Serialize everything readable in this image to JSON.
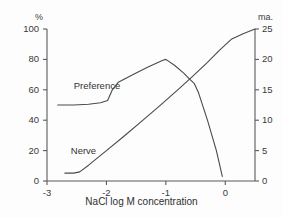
{
  "chart_data": {
    "type": "line",
    "title": "",
    "subtitle": "",
    "xlabel": "NaCl log M concentration",
    "ylabel_left": "%",
    "ylabel_right": "ma.",
    "xlim": [
      -3.0,
      0.5
    ],
    "xticks": [
      -3,
      -2,
      -1,
      0
    ],
    "xticklabels": [
      "-3",
      "-2",
      "-1",
      "0"
    ],
    "ylim_left": [
      0,
      100
    ],
    "yticks_left": [
      0,
      20,
      40,
      60,
      80,
      100
    ],
    "yticklabels_left": [
      "0",
      "20",
      "40",
      "60",
      "80",
      "100"
    ],
    "ylim_right": [
      0,
      25
    ],
    "yticks_right": [
      0,
      5,
      10,
      15,
      20,
      25
    ],
    "yticklabels_right": [
      "0",
      "5",
      "10",
      "15",
      "20",
      "25"
    ],
    "grid": false,
    "legend_position": "inline-annotations",
    "series": [
      {
        "name": "Preference",
        "axis": "left",
        "unit": "%",
        "color": "#4a4a4a",
        "x": [
          -2.82,
          -2.55,
          -2.3,
          -2.1,
          -1.98,
          -1.9,
          -1.8,
          -1.55,
          -1.3,
          -1.05,
          -1.0,
          -0.85,
          -0.7,
          -0.6,
          -0.52,
          -0.45,
          -0.3,
          -0.15,
          -0.05
        ],
        "y": [
          50,
          50,
          50.5,
          51.5,
          53,
          60,
          65,
          70,
          75,
          79.5,
          80,
          76,
          71,
          67,
          64,
          58,
          40,
          20,
          3
        ]
      },
      {
        "name": "Nerve",
        "axis": "right",
        "unit": "ma.",
        "color": "#4a4a4a",
        "x": [
          -2.7,
          -2.55,
          -2.45,
          -2.3,
          -2.0,
          -1.7,
          -1.4,
          -1.1,
          -0.8,
          -0.55,
          -0.3,
          -0.1,
          0.1,
          0.3,
          0.5
        ],
        "y": [
          1.3,
          1.3,
          1.5,
          2.6,
          5.0,
          7.4,
          9.9,
          12.4,
          15.0,
          17.2,
          19.5,
          21.5,
          23.3,
          24.2,
          25.0
        ]
      }
    ],
    "annotations": [
      {
        "text": "Preference",
        "x": -2.55,
        "y": 62,
        "axis": "left"
      },
      {
        "text": "Nerve",
        "x": -2.6,
        "y": 19,
        "axis": "left"
      }
    ]
  }
}
